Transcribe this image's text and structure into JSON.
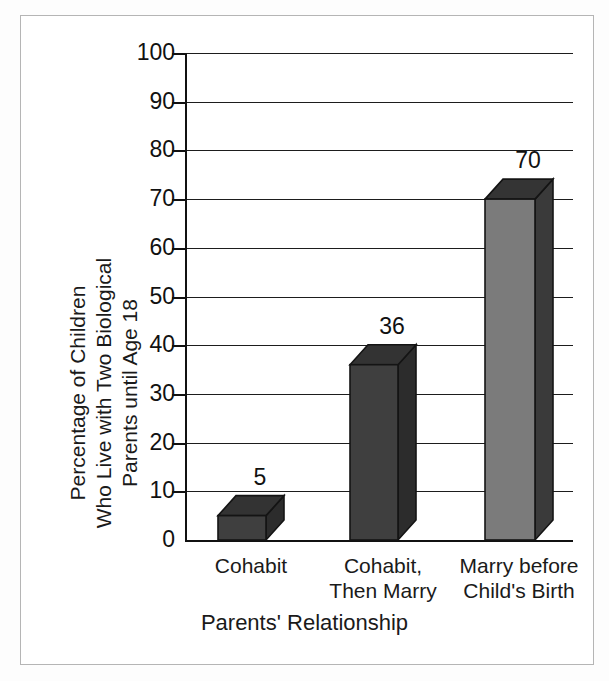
{
  "chart_data": {
    "type": "bar",
    "title": "",
    "subtitle": "",
    "xlabel": "Parents' Relationship",
    "ylabel": "Percentage of Children\nWho Live with Two Biological\nParents until Age 18",
    "categories": [
      "Cohabit",
      "Cohabit,\nThen Marry",
      "Marry before\nChild's Birth"
    ],
    "values": [
      5,
      36,
      70
    ],
    "value_labels": [
      "5",
      "36",
      "70"
    ],
    "ylim": [
      0,
      100
    ],
    "ytick_step": 10,
    "yticks": [
      0,
      10,
      20,
      30,
      40,
      50,
      60,
      70,
      80,
      90,
      100
    ],
    "ytick_labels": [
      "0",
      "10",
      "20",
      "30",
      "40",
      "50",
      "60",
      "70",
      "80",
      "90",
      "100"
    ],
    "grid": "horizontal",
    "legend": "none",
    "style": "3d-bar",
    "series": [
      {
        "name": "Percentage of Children Who Live with Two Biological Parents until Age 18",
        "values": [
          5,
          36,
          70
        ]
      }
    ]
  },
  "axes": {
    "y": {
      "min": "0",
      "max": "100",
      "tick_labels": [
        "100",
        "90",
        "80",
        "70",
        "60",
        "50",
        "40",
        "30",
        "20",
        "10",
        "0"
      ],
      "title_line1": "Percentage of Children",
      "title_line2": "Who Live with Two Biological",
      "title_line3": "Parents until Age 18"
    },
    "x": {
      "title": "Parents' Relationship",
      "tick_labels": [
        "Cohabit",
        "Cohabit,\nThen Marry",
        "Marry before\nChild's Birth"
      ]
    }
  },
  "bars": [
    {
      "category": "Cohabit",
      "value": 5,
      "label": "5",
      "front_color": "#3f3f3f",
      "side_color": "#2c2c2c",
      "top_color": "#333333"
    },
    {
      "category": "Cohabit, Then Marry",
      "value": 36,
      "label": "36",
      "front_color": "#3f3f3f",
      "side_color": "#2c2c2c",
      "top_color": "#333333"
    },
    {
      "category": "Marry before Child's Birth",
      "value": 70,
      "label": "70",
      "front_color": "#7b7b7b",
      "side_color": "#3a3a3a",
      "top_color": "#343434"
    }
  ],
  "colors": {
    "background": "#ffffff",
    "frame_border": "#b5b5b5",
    "axis": "#111111",
    "gridline": "#1d1d1d",
    "text": "#1a1a1a",
    "bar_dark_front": "#3f3f3f",
    "bar_light_front": "#7b7b7b",
    "bar_side": "#2c2c2c",
    "bar_top": "#333333"
  }
}
